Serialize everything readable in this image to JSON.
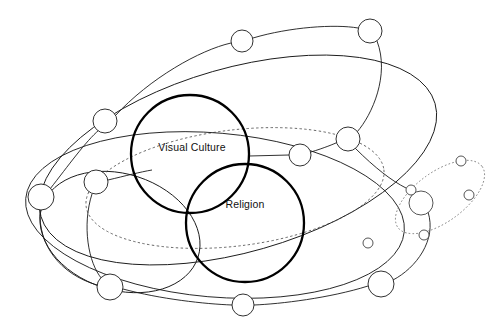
{
  "diagram": {
    "background_color": "#ffffff",
    "stroke_color": "#1a1a1a",
    "main_stroke_color": "#000000",
    "label_color": "#111111",
    "width": 503,
    "height": 331
  },
  "main_circles": [
    {
      "id": "visual-culture",
      "label": "Visual Culture",
      "cx": 190,
      "cy": 154,
      "r": 59,
      "label_x": 192,
      "label_y": 148,
      "stroke_width": 2.3
    },
    {
      "id": "religion",
      "label": "Religion",
      "cx": 245,
      "cy": 223,
      "r": 59,
      "label_x": 245,
      "label_y": 205,
      "stroke_width": 2.3
    }
  ],
  "orbits": [
    {
      "id": "outer-solid-ellipse",
      "style": "solid",
      "cx": 238,
      "cy": 160,
      "rx": 205,
      "ry": 92,
      "rotation": -16
    },
    {
      "id": "inner-dashed-ellipse",
      "style": "dashed",
      "cx": 235,
      "cy": 188,
      "rx": 150,
      "ry": 58,
      "rotation": -7
    },
    {
      "id": "lower-solid-ellipse",
      "style": "solid",
      "cx": 215,
      "cy": 215,
      "rx": 190,
      "ry": 82,
      "rotation": 5
    },
    {
      "id": "left-solid-loop",
      "style": "solid",
      "cx": 120,
      "cy": 232,
      "rx": 82,
      "ry": 58,
      "rotation": 18
    },
    {
      "id": "satellite-dotted-ellipse",
      "style": "dotted",
      "cx": 440,
      "cy": 197,
      "rx": 52,
      "ry": 25,
      "rotation": -36
    }
  ],
  "nodes": [
    {
      "id": "node-top-center",
      "cx": 242,
      "cy": 41,
      "r": 11
    },
    {
      "id": "node-top-right",
      "cx": 370,
      "cy": 31,
      "r": 12
    },
    {
      "id": "node-upper-left",
      "cx": 105,
      "cy": 121,
      "r": 12
    },
    {
      "id": "node-right-upper",
      "cx": 348,
      "cy": 139,
      "r": 12
    },
    {
      "id": "node-mid-right",
      "cx": 300,
      "cy": 155,
      "r": 11
    },
    {
      "id": "node-left-mid",
      "cx": 96,
      "cy": 182,
      "r": 12
    },
    {
      "id": "node-far-left",
      "cx": 41,
      "cy": 197,
      "r": 13
    },
    {
      "id": "node-lower-left",
      "cx": 110,
      "cy": 287,
      "r": 13
    },
    {
      "id": "node-bottom-center",
      "cx": 243,
      "cy": 305,
      "r": 11
    },
    {
      "id": "node-bottom-right",
      "cx": 381,
      "cy": 284,
      "r": 13
    }
  ],
  "satellite_nodes": [
    {
      "id": "sat-node-hub",
      "cx": 421,
      "cy": 203,
      "r": 12
    },
    {
      "id": "sat-node-left",
      "cx": 411,
      "cy": 190,
      "r": 5
    },
    {
      "id": "sat-node-top",
      "cx": 461,
      "cy": 161,
      "r": 5
    },
    {
      "id": "sat-node-right",
      "cx": 469,
      "cy": 195,
      "r": 5
    },
    {
      "id": "sat-node-bottom",
      "cx": 424,
      "cy": 235,
      "r": 5
    },
    {
      "id": "sat-node-far-left",
      "cx": 368,
      "cy": 243,
      "r": 5
    }
  ],
  "links": [
    {
      "id": "link-vc-to-mid-right",
      "d": "M 249 156 L 289 155"
    },
    {
      "id": "link-left-mid-to-vc",
      "d": "M 108 180 C 125 176 140 172 152 170"
    },
    {
      "id": "link-far-left-to-upper-left",
      "d": "M 50 189 C 68 166 86 141 99 130"
    },
    {
      "id": "link-upper-left-to-top-center",
      "d": "M 115 116 C 150 78 200 50 231 43"
    },
    {
      "id": "link-top-center-to-top-right",
      "d": "M 253 38 C 290 27 335 24 358 28"
    },
    {
      "id": "link-top-right-to-right-upper",
      "d": "M 377 41 C 390 75 372 115 357 132"
    },
    {
      "id": "link-right-upper-to-sat",
      "d": "M 355 148 C 375 168 392 181 406 188"
    },
    {
      "id": "link-mid-right-to-right-upper",
      "d": "M 311 152 C 324 148 334 144 338 142"
    },
    {
      "id": "link-sat-hub-to-bottom-right",
      "d": "M 428 212 C 437 240 416 268 393 280"
    },
    {
      "id": "link-bottom-right-to-bottom-center",
      "d": "M 368 286 C 330 298 280 304 254 305"
    },
    {
      "id": "link-lower-left-to-bottom-center",
      "d": "M 123 289 C 160 299 205 304 232 305"
    },
    {
      "id": "link-far-left-to-lower-left",
      "d": "M 40 210 C 38 245 60 274 97 285"
    },
    {
      "id": "link-left-mid-to-lower-left",
      "d": "M 92 194 C 82 225 88 263 102 279"
    }
  ]
}
